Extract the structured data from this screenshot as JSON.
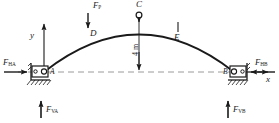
{
  "figure": {
    "type": "engineering-statics-diagram",
    "colors": {
      "line": "#1a1a1a",
      "axis_dash": "#8a8a8a",
      "background": "#ffffff"
    }
  },
  "axes": {
    "y_label": "y",
    "x_label": "x"
  },
  "arch": {
    "points": [
      {
        "id": "A",
        "label": "A",
        "role": "left-pin-support"
      },
      {
        "id": "D",
        "label": "D",
        "role": "arch-point-left"
      },
      {
        "id": "C",
        "label": "C",
        "role": "crown-hinge"
      },
      {
        "id": "E",
        "label": "E",
        "role": "arch-point-right"
      },
      {
        "id": "B",
        "label": "B",
        "role": "right-pin-support"
      }
    ]
  },
  "loads": [
    {
      "id": "FP",
      "symbol": "F",
      "subscript": "P",
      "applied_at": "D",
      "direction": "down"
    }
  ],
  "reactions": [
    {
      "id": "FHA",
      "symbol": "F",
      "subscript": "HA",
      "at": "A",
      "direction": "right"
    },
    {
      "id": "FVA",
      "symbol": "F",
      "subscript": "VA",
      "at": "A",
      "direction": "up"
    },
    {
      "id": "FHB",
      "symbol": "F",
      "subscript": "HB",
      "at": "B",
      "direction": "left"
    },
    {
      "id": "FVB",
      "symbol": "F",
      "subscript": "VB",
      "at": "B",
      "direction": "up"
    }
  ],
  "dimensions": [
    {
      "id": "rise",
      "value": "4",
      "unit": "m",
      "text": "4 m",
      "from": "C",
      "to": "springing-line",
      "orientation": "vertical"
    }
  ]
}
